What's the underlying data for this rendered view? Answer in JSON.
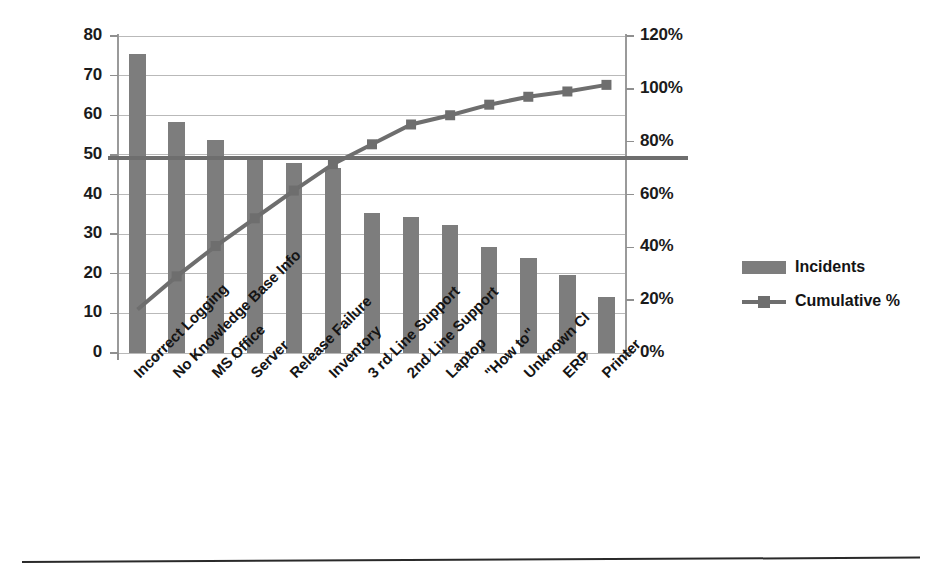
{
  "chart_data": {
    "type": "bar",
    "title": "",
    "subtitle": "",
    "xlabel": "",
    "ylabel": "",
    "grid": true,
    "legend_position": "right",
    "categories": [
      "Incorrect Logging",
      "No Knowledge Base Info",
      "MS Office",
      "Server",
      "Release Failure",
      "Inventory",
      "3 rd Line Support",
      "2nd Line Support",
      "Laptop",
      "\"How to\"",
      "Unknown CI",
      "ERP",
      "Printer"
    ],
    "series": [
      {
        "name": "Incidents",
        "type": "bar",
        "axis": "left",
        "color": "#7d7d7d",
        "values": [
          75.5,
          58.2,
          53.7,
          49.8,
          48.0,
          46.6,
          35.4,
          34.3,
          32.2,
          26.7,
          23.9,
          19.8,
          14.2
        ]
      },
      {
        "name": "Cumulative %",
        "type": "line",
        "axis": "right",
        "color": "#6e6e6e",
        "marker": "square",
        "values": [
          16.5,
          29.0,
          40.5,
          51.0,
          61.5,
          71.5,
          79.0,
          86.5,
          90.0,
          94.0,
          97.0,
          99.0,
          101.5
        ]
      }
    ],
    "threshold_line": {
      "left_axis_value": 49.5,
      "right_axis_value": 71.5,
      "color": "#6e6e6e"
    },
    "y_left": {
      "min": 0,
      "max": 80,
      "step": 10,
      "ticks": [
        "0",
        "10",
        "20",
        "30",
        "40",
        "50",
        "60",
        "70",
        "80"
      ]
    },
    "y_right": {
      "min": 0,
      "max": 120,
      "step": 20,
      "ticks": [
        "0%",
        "20%",
        "40%",
        "60%",
        "80%",
        "100%",
        "120%"
      ]
    }
  },
  "legend": {
    "items": [
      {
        "label": "Incidents",
        "marker": "bar-swatch"
      },
      {
        "label": "Cumulative %",
        "marker": "line-square-swatch"
      }
    ]
  },
  "colors": {
    "bar": "#7d7d7d",
    "line": "#6e6e6e",
    "grid": "#b9b9b9",
    "axis": "#9a9a9a",
    "text": "#141414",
    "background": "#ffffff",
    "rule": "#2a2a2a"
  }
}
